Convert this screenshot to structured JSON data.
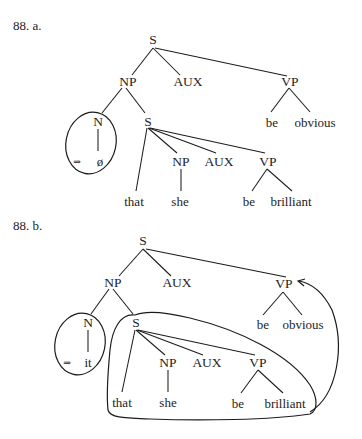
{
  "figure_a": {
    "label": "88. a.",
    "root": "S",
    "np": "NP",
    "aux": "AUX",
    "vp": "VP",
    "n": "N",
    "sub_s": "S",
    "vp_be": "be",
    "vp_adj": "obvious",
    "arrow": "⇒",
    "n_value": "ø",
    "sub_np": "NP",
    "sub_aux": "AUX",
    "sub_vp": "VP",
    "comp": "that",
    "pronoun": "she",
    "sub_vp_be": "be",
    "sub_vp_adj": "brilliant"
  },
  "figure_b": {
    "label": "88. b.",
    "root": "S",
    "np": "NP",
    "aux": "AUX",
    "vp": "VP",
    "n": "N",
    "sub_s": "S",
    "vp_be": "be",
    "vp_adj": "obvious",
    "arrow": "⇒",
    "n_value": "it",
    "sub_np": "NP",
    "sub_aux": "AUX",
    "sub_vp": "VP",
    "comp": "that",
    "pronoun": "she",
    "sub_vp_be": "be",
    "sub_vp_adj": "brilliant"
  }
}
